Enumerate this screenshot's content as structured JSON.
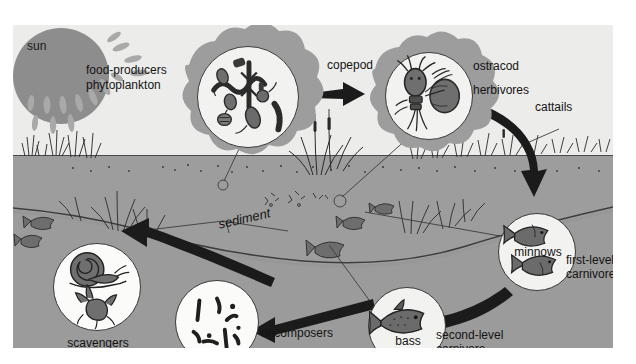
{
  "diagram": {
    "palette": {
      "sky": "#ececeb",
      "water": "#9d9d9d",
      "sun": "#8d8d8d",
      "blob": "#9a9a9a",
      "circle_fill": "#f2f2f0",
      "ink": "#1b1b1b",
      "arrow": "#1d1d1d"
    }
  },
  "labels": {
    "sun": "sun",
    "food_producers": "food-producers",
    "phytoplankton": "phytoplankton",
    "copepod": "copepod",
    "ostracod": "ostracod",
    "herbivores": "herbivores",
    "cattails": "cattails",
    "minnows": "minnows",
    "first_level": "first-level",
    "carnivore_1": "carnivore",
    "bass": "bass",
    "second_level": "second-level",
    "carnivore_2": "carnivore",
    "decomposers": "decomposers",
    "scavengers": "scavengers",
    "sediment": "sediment"
  },
  "nodes": [
    {
      "id": "phytoplankton",
      "label": "food-producers phytoplankton",
      "role": "producer"
    },
    {
      "id": "herbivores",
      "label": "copepod / ostracod",
      "role": "herbivores"
    },
    {
      "id": "minnows",
      "label": "minnows",
      "role": "first-level carnivore"
    },
    {
      "id": "bass",
      "label": "bass",
      "role": "second-level carnivore"
    },
    {
      "id": "decomposers",
      "label": "decomposers",
      "role": "decomposer"
    },
    {
      "id": "scavengers",
      "label": "scavengers",
      "role": "scavenger"
    },
    {
      "id": "cattails",
      "label": "cattails",
      "role": "producer"
    },
    {
      "id": "sediment",
      "label": "sediment",
      "role": "substrate"
    }
  ],
  "flows": [
    {
      "from": "phytoplankton",
      "to": "herbivores"
    },
    {
      "from": "herbivores",
      "to": "minnows"
    },
    {
      "from": "minnows",
      "to": "bass"
    },
    {
      "from": "bass",
      "to": "decomposers"
    },
    {
      "from": "decomposers",
      "to": "scavengers"
    }
  ]
}
